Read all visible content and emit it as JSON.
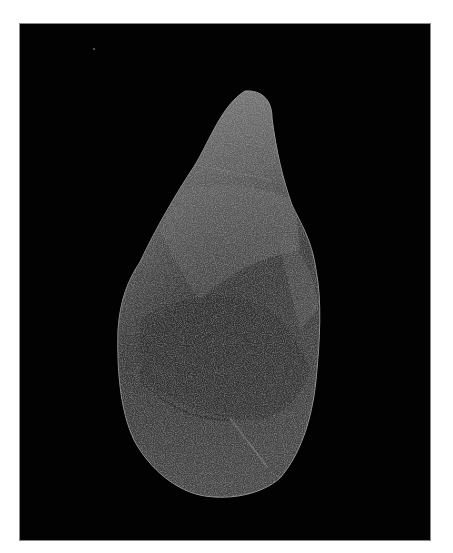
{
  "image": {
    "subject": "Stone hand-axe (biface) photographed on black background",
    "alt": "Grey flaked stone hand axe, teardrop shaped, on a black backdrop with white border",
    "colors": {
      "background": "#020202",
      "border": "#ffffff",
      "stone_light": "#8f8f8f",
      "stone_mid": "#5a5a5a",
      "stone_dark": "#2a2a2a"
    }
  }
}
